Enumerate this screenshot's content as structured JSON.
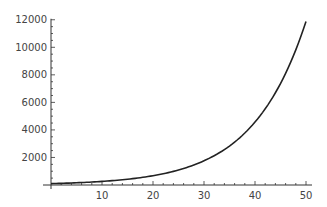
{
  "chart_data": {
    "type": "line",
    "title": "",
    "xlabel": "",
    "ylabel": "",
    "xlim": [
      0,
      50
    ],
    "ylim": [
      0,
      12000
    ],
    "grid": false,
    "legend": null,
    "x_ticks": [
      10,
      20,
      30,
      40,
      50
    ],
    "y_ticks": [
      2000,
      4000,
      6000,
      8000,
      10000,
      12000
    ],
    "series": [
      {
        "name": "curve",
        "color": "#222222",
        "x": [
          0,
          5,
          10,
          15,
          20,
          25,
          30,
          35,
          40,
          45,
          50
        ],
        "y": [
          100,
          161,
          260,
          419,
          676,
          1090,
          1760,
          2830,
          4570,
          7370,
          11880
        ]
      }
    ]
  },
  "plot": {
    "origin_px": [
      51,
      185
    ],
    "x_scale_px_per_unit": 5.1,
    "y_scale_px_per_unit": 0.01377,
    "axis_color": "#333333",
    "line_color": "#222222"
  }
}
